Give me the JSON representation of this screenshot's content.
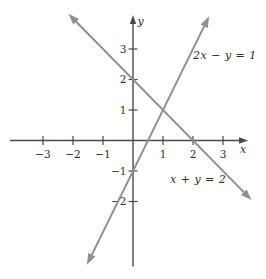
{
  "figure": {
    "background_color": "#ffffff",
    "axis_color": "#4a4a4a",
    "series_line_color": "#8f8f8f",
    "text_color": "#2b2b2b"
  },
  "chart_data": {
    "type": "line",
    "title": "",
    "xlabel": "x",
    "ylabel": "y",
    "xlim": [
      -4.1,
      3.85
    ],
    "ylim": [
      -4.6,
      4.2
    ],
    "grid": false,
    "legend": "inline-annotations",
    "x_ticks": [
      -3,
      -2,
      -1,
      1,
      2,
      3
    ],
    "y_ticks": [
      -2,
      -1,
      1,
      2,
      3
    ],
    "series": [
      {
        "name": "2x − y = 1",
        "slope": 2,
        "intercept": -1,
        "x_range": [
          -1.44,
          2.44
        ],
        "points": [
          [
            0,
            -1
          ],
          [
            0.5,
            0
          ],
          [
            1,
            1
          ],
          [
            2,
            3
          ]
        ]
      },
      {
        "name": "x + y = 2",
        "slope": -1,
        "intercept": 2,
        "x_range": [
          -2.0,
          3.8
        ],
        "points": [
          [
            -2,
            4
          ],
          [
            0,
            2
          ],
          [
            1,
            1
          ],
          [
            2,
            0
          ]
        ]
      }
    ]
  },
  "annotations": {
    "line1_label": "2x − y = 1",
    "line2_label": "x + y = 2"
  }
}
